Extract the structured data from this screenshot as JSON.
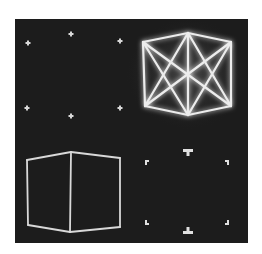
{
  "figure": {
    "background": "#ffffff",
    "panel": {
      "x": 15,
      "y": 19,
      "width": 233,
      "height": 224,
      "color": "#1c1c1c"
    },
    "line_color": "#e8e8e8",
    "glow_color": "#ffffff",
    "quadrants": {
      "top_left": {
        "description": "vertex points only (8 star dots)",
        "points": [
          [
            28,
            43
          ],
          [
            71,
            34
          ],
          [
            120,
            41
          ],
          [
            27,
            108
          ],
          [
            71,
            116
          ],
          [
            120,
            108
          ]
        ]
      },
      "top_right": {
        "description": "wireframe cube with all diagonals, glowing",
        "vertices": {
          "top": [
            188,
            33
          ],
          "left_top": [
            143,
            42
          ],
          "right_top": [
            231,
            42
          ],
          "left_bottom": [
            145,
            106
          ],
          "right_bottom": [
            231,
            106
          ],
          "bottom": [
            188,
            115
          ]
        }
      },
      "bottom_left": {
        "description": "wireframe cube, front edges only",
        "vertices": {
          "top_mid": [
            71,
            152
          ],
          "left_top": [
            27,
            160
          ],
          "right_top": [
            120,
            158
          ],
          "left_bottom": [
            28,
            225
          ],
          "right_bottom": [
            120,
            227
          ],
          "bottom_mid": [
            70,
            232
          ]
        }
      },
      "bottom_right": {
        "description": "corner bracket markers",
        "markers": {
          "top_tee": [
            188,
            152
          ],
          "bottom_tee": [
            188,
            231
          ],
          "corner_tl": [
            145,
            160
          ],
          "corner_tr": [
            229,
            160
          ],
          "corner_bl": [
            145,
            225
          ],
          "corner_br": [
            229,
            225
          ]
        }
      }
    }
  }
}
